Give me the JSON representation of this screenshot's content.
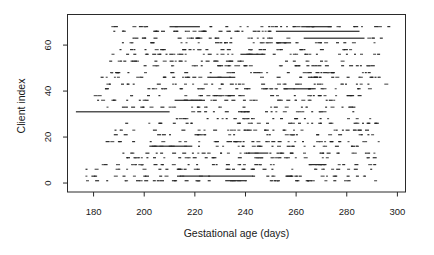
{
  "figure": {
    "background": "#ffffff",
    "width": 434,
    "height": 255
  },
  "chart_data": {
    "type": "scatter",
    "marker": "-",
    "title": "",
    "xlabel": "Gestational age (days)",
    "ylabel": "Client index",
    "x_ticks": [
      180,
      200,
      220,
      240,
      260,
      280,
      300
    ],
    "y_ticks": [
      0,
      20,
      40,
      60
    ],
    "xlim": [
      169.7,
      303.2
    ],
    "ylim": [
      -3.9,
      73.3
    ],
    "grid": false,
    "legend": null,
    "axis_color": "#2a2a2a",
    "point_color": "#1c1c1c",
    "point_color_light": "#4d4d4d",
    "run_color": "#2b2b2b",
    "rows": [
      {
        "client": 1,
        "spans": [
          [
            176,
            298,
            40
          ]
        ],
        "runs": [
          [
            232,
            240
          ]
        ]
      },
      {
        "client": 3,
        "spans": [
          [
            175,
            295,
            34
          ]
        ],
        "runs": [
          [
            214,
            243
          ]
        ]
      },
      {
        "client": 6,
        "spans": [
          [
            174,
            290,
            34
          ]
        ],
        "runs": []
      },
      {
        "client": 8,
        "spans": [
          [
            179,
            292,
            38
          ]
        ],
        "runs": [
          [
            265,
            272
          ]
        ]
      },
      {
        "client": 11,
        "spans": [
          [
            188,
            293,
            36
          ]
        ],
        "runs": []
      },
      {
        "client": 13,
        "spans": [
          [
            190,
            291,
            38
          ]
        ],
        "runs": [
          [
            241,
            249
          ]
        ]
      },
      {
        "client": 16,
        "spans": [
          [
            199,
            290,
            30
          ]
        ],
        "runs": [
          [
            202,
            219
          ]
        ]
      },
      {
        "client": 18,
        "spans": [
          [
            184,
            205,
            6
          ],
          [
            206,
            296,
            34
          ]
        ],
        "runs": []
      },
      {
        "client": 21,
        "spans": [
          [
            187,
            290,
            28
          ]
        ],
        "runs": []
      },
      {
        "client": 23,
        "spans": [
          [
            187,
            208,
            5
          ],
          [
            209,
            294,
            30
          ]
        ],
        "runs": []
      },
      {
        "client": 26,
        "spans": [
          [
            190,
            204,
            2
          ],
          [
            205,
            292,
            28
          ]
        ],
        "runs": []
      },
      {
        "client": 28,
        "spans": [
          [
            210,
            290,
            26
          ]
        ],
        "runs": []
      },
      {
        "client": 31,
        "spans": [
          [
            210,
            286,
            24
          ]
        ],
        "runs": [
          [
            173,
            210
          ]
        ]
      },
      {
        "client": 33,
        "spans": [
          [
            181,
            288,
            32
          ]
        ],
        "runs": []
      },
      {
        "client": 36,
        "spans": [
          [
            180,
            290,
            36
          ]
        ],
        "runs": [
          [
            212,
            224
          ]
        ]
      },
      {
        "client": 38,
        "spans": [
          [
            178,
            292,
            38
          ]
        ],
        "runs": []
      },
      {
        "client": 41,
        "spans": [
          [
            180,
            291,
            38
          ]
        ],
        "runs": [
          [
            255,
            265
          ]
        ]
      },
      {
        "client": 43,
        "spans": [
          [
            183,
            295,
            36
          ]
        ],
        "runs": []
      },
      {
        "client": 46,
        "spans": [
          [
            181,
            293,
            40
          ]
        ],
        "runs": [
          [
            226,
            236
          ]
        ]
      },
      {
        "client": 48,
        "spans": [
          [
            184,
            290,
            34
          ]
        ],
        "runs": []
      },
      {
        "client": 51,
        "spans": [
          [
            186,
            294,
            38
          ]
        ],
        "runs": []
      },
      {
        "client": 53,
        "spans": [
          [
            185,
            290,
            34
          ]
        ],
        "runs": []
      },
      {
        "client": 56,
        "spans": [
          [
            185,
            292,
            38
          ]
        ],
        "runs": [
          [
            238,
            247
          ]
        ]
      },
      {
        "client": 58,
        "spans": [
          [
            190,
            288,
            32
          ]
        ],
        "runs": []
      },
      {
        "client": 61,
        "spans": [
          [
            186,
            296,
            36
          ]
        ],
        "runs": [
          [
            252,
            258
          ]
        ]
      },
      {
        "client": 63,
        "spans": [
          [
            186,
            262,
            26
          ],
          [
            288,
            298,
            4
          ]
        ],
        "runs": [
          [
            263,
            287
          ]
        ]
      },
      {
        "client": 66,
        "spans": [
          [
            184,
            250,
            30
          ]
        ],
        "runs": [
          [
            252,
            285
          ]
        ]
      },
      {
        "client": 68,
        "spans": [
          [
            185,
            296,
            34
          ]
        ],
        "runs": [
          [
            210,
            222
          ],
          [
            262,
            274
          ]
        ]
      }
    ]
  }
}
